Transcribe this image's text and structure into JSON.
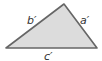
{
  "diagram": {
    "type": "triangle",
    "vertices": {
      "left": [
        6,
        48
      ],
      "top": [
        64,
        4
      ],
      "right": [
        97,
        48
      ]
    },
    "fill_color": "#dcdcdc",
    "stroke_color": "#666666",
    "labels": {
      "a": "a′",
      "b": "b′",
      "c": "c′"
    }
  }
}
